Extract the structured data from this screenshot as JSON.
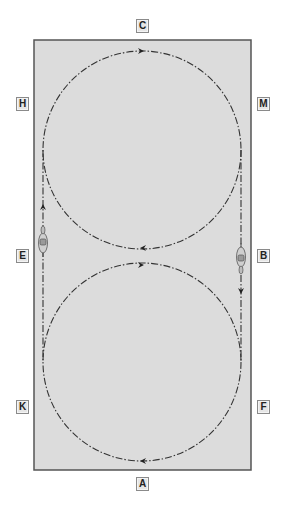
{
  "diagram": {
    "title": "",
    "arena": {
      "x": 34,
      "y": 40,
      "width": 217,
      "height": 430,
      "fill": "#dcdcdc",
      "border": "#555555"
    },
    "markers": [
      {
        "letter": "C",
        "x": 136,
        "y": 19
      },
      {
        "letter": "H",
        "x": 16,
        "y": 97
      },
      {
        "letter": "M",
        "x": 257,
        "y": 97
      },
      {
        "letter": "E",
        "x": 16,
        "y": 249
      },
      {
        "letter": "B",
        "x": 257,
        "y": 249
      },
      {
        "letter": "K",
        "x": 16,
        "y": 400
      },
      {
        "letter": "F",
        "x": 257,
        "y": 400
      },
      {
        "letter": "A",
        "x": 136,
        "y": 477
      }
    ],
    "figure": {
      "description": "Two 20m circles joined through straight lines on the long sides (figure-of-eight style track)",
      "upper_circle": {
        "cx": 142,
        "cy": 150,
        "r": 99
      },
      "lower_circle": {
        "cx": 142,
        "cy": 362,
        "r": 99
      },
      "left_track_x": 43,
      "right_track_x": 241,
      "line_color": "#333333",
      "line_style": "dash-dot"
    },
    "arrows": [
      {
        "name": "upper-circle-top",
        "x": 142,
        "y": 51,
        "direction": "right"
      },
      {
        "name": "upper-circle-bottom",
        "x": 142,
        "y": 248,
        "direction": "left"
      },
      {
        "name": "lower-circle-top",
        "x": 142,
        "y": 265,
        "direction": "right"
      },
      {
        "name": "lower-circle-bottom",
        "x": 142,
        "y": 461,
        "direction": "left"
      },
      {
        "name": "left-track",
        "x": 43,
        "y": 206,
        "direction": "up"
      },
      {
        "name": "right-track",
        "x": 241,
        "y": 292,
        "direction": "down"
      }
    ],
    "horses": [
      {
        "name": "horse-at-E",
        "x": 43,
        "y": 241,
        "direction": "up"
      },
      {
        "name": "horse-at-B",
        "x": 241,
        "y": 259,
        "direction": "down"
      }
    ]
  }
}
